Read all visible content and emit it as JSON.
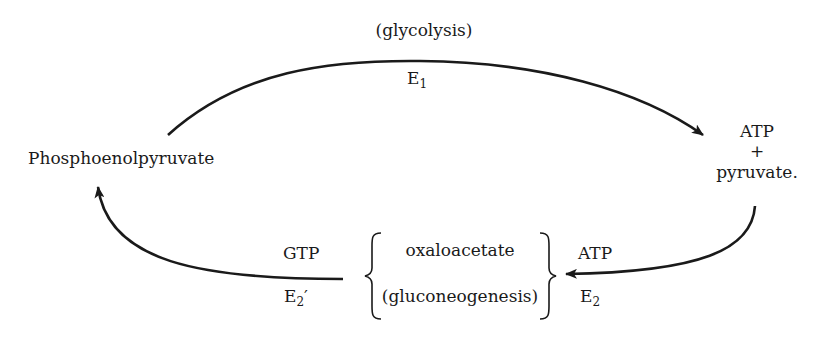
{
  "diagram": {
    "type": "metabolic-cycle",
    "nodes": {
      "left": "Phosphoenolpyruvate",
      "right_top": "ATP",
      "right_plus": "+",
      "right_bottom": "pyruvate.",
      "middle_top": "oxaloacetate",
      "middle_bottom": "(gluconeogenesis)"
    },
    "top_arrow": {
      "label_above": "(glycolysis)",
      "enzyme": "E",
      "enzyme_sub": "1"
    },
    "right_arrow": {
      "cofactor": "ATP",
      "enzyme": "E",
      "enzyme_sub": "2"
    },
    "left_arrow": {
      "cofactor": "GTP",
      "enzyme": "E",
      "enzyme_sub": "2",
      "enzyme_prime": "′"
    },
    "stroke_color": "#1a1a1a"
  }
}
